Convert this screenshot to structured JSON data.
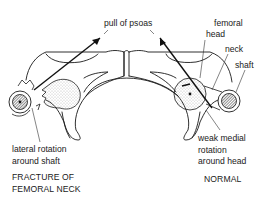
{
  "labels": {
    "pull": "pull of psoas",
    "femoral": "femoral",
    "head": "head",
    "neck": "neck",
    "shaft": "shaft",
    "weak1": "weak medial",
    "weak2": "rotation",
    "weak3": "around head",
    "lat1": "lateral rotation",
    "lat2": "around shaft"
  },
  "captions": {
    "left1": "FRACTURE OF",
    "left2": "FEMORAL NECK",
    "right": "NORMAL"
  },
  "colors": {
    "line": "#1a1a1a",
    "hatch": "#555555",
    "stipple": "#bbbbbb"
  }
}
